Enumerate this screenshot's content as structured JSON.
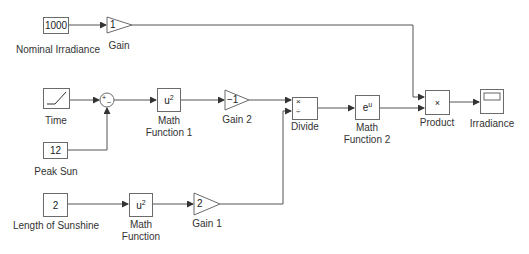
{
  "diagram": {
    "blocks": {
      "nominal_irradiance": {
        "value": "1000",
        "label": "Nominal Irradiance"
      },
      "gain": {
        "value": "1",
        "label": "Gain"
      },
      "time": {
        "label": "Time",
        "icon": "ramp-icon"
      },
      "sum": {
        "signs": "+-",
        "plus": "+",
        "minus": "–"
      },
      "peak_sun": {
        "value": "12",
        "label": "Peak Sun"
      },
      "math_function_1": {
        "base": "u",
        "exp": "2",
        "label_line1": "Math",
        "label_line2": "Function 1"
      },
      "gain_2": {
        "value": "−1",
        "label": "Gain 2"
      },
      "divide": {
        "port1": "×",
        "port2": "÷",
        "label": "Divide"
      },
      "math_function_2": {
        "base": "e",
        "exp": "u",
        "label_line1": "Math",
        "label_line2": "Function 2"
      },
      "product": {
        "symbol": "×",
        "label": "Product"
      },
      "irradiance": {
        "label": "Irradiance",
        "icon": "scope-icon"
      },
      "length_of_sunshine": {
        "value": "2",
        "label": "Length of Sunshine"
      },
      "math_function": {
        "base": "u",
        "exp": "2",
        "label_line1": "Math",
        "label_line2": "Function"
      },
      "gain_1": {
        "value": "2",
        "label": "Gain 1"
      }
    },
    "colors": {
      "line": "#555555",
      "border": "#6b6b6b",
      "background": "#ffffff"
    }
  }
}
